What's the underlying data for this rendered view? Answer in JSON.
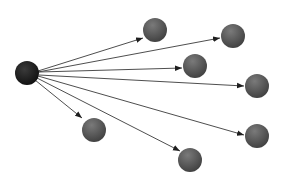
{
  "diagram": {
    "type": "star-graph",
    "width": 283,
    "height": 181,
    "colors": {
      "background": "#ffffff",
      "hub_fill_dark": "#0f0f0f",
      "hub_fill_light": "#3a3a3a",
      "node_fill_dark": "#3e3e3e",
      "node_fill_light": "#7a7a7a",
      "edge": "#3a3a3a"
    },
    "hub": {
      "id": "hub",
      "cx": 27,
      "cy": 73,
      "r": 12
    },
    "nodes": [
      {
        "id": "n1",
        "cx": 155,
        "cy": 30,
        "r": 12
      },
      {
        "id": "n2",
        "cx": 233,
        "cy": 36,
        "r": 12
      },
      {
        "id": "n3",
        "cx": 195,
        "cy": 66,
        "r": 12
      },
      {
        "id": "n4",
        "cx": 257,
        "cy": 86,
        "r": 12
      },
      {
        "id": "n5",
        "cx": 257,
        "cy": 136,
        "r": 12
      },
      {
        "id": "n6",
        "cx": 190,
        "cy": 160,
        "r": 12
      },
      {
        "id": "n7",
        "cx": 94,
        "cy": 130,
        "r": 12
      }
    ],
    "edges": [
      {
        "from": "hub",
        "to": "n1",
        "x1": 38,
        "y1": 71,
        "x2": 143,
        "y2": 38
      },
      {
        "from": "hub",
        "to": "n2",
        "x1": 38,
        "y1": 72,
        "x2": 220,
        "y2": 38
      },
      {
        "from": "hub",
        "to": "n3",
        "x1": 39,
        "y1": 72,
        "x2": 182,
        "y2": 68
      },
      {
        "from": "hub",
        "to": "n4",
        "x1": 39,
        "y1": 75,
        "x2": 244,
        "y2": 86
      },
      {
        "from": "hub",
        "to": "n5",
        "x1": 38,
        "y1": 76,
        "x2": 244,
        "y2": 135
      },
      {
        "from": "hub",
        "to": "n6",
        "x1": 37,
        "y1": 78,
        "x2": 180,
        "y2": 151
      },
      {
        "from": "hub",
        "to": "n7",
        "x1": 35,
        "y1": 80,
        "x2": 82,
        "y2": 118
      }
    ]
  }
}
